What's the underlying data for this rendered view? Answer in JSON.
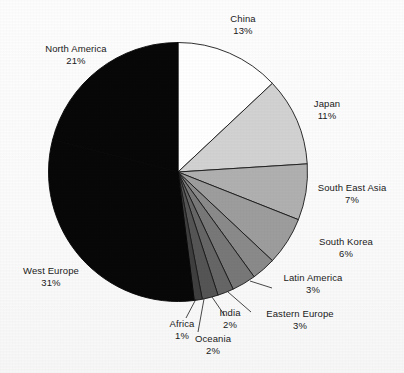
{
  "chart_data": {
    "type": "pie",
    "title": "",
    "subtitle": "",
    "xlabel": "",
    "ylabel": "",
    "grid": false,
    "legend_position": "none",
    "label_format": "name above percent",
    "start_angle_deg": 0,
    "direction": "clockwise",
    "categories": [
      "China",
      "Japan",
      "South East Asia",
      "South Korea",
      "Latin America",
      "Eastern Europe",
      "India",
      "Oceania",
      "Africa",
      "West Europe",
      "North America"
    ],
    "values": [
      13,
      11,
      7,
      6,
      3,
      3,
      2,
      2,
      1,
      31,
      21
    ],
    "value_unit": "%",
    "total": 100,
    "slices": [
      {
        "label": "China",
        "value": 13,
        "percent_text": "13%",
        "color": "#ffffff",
        "stroke": "#1a1a1a"
      },
      {
        "label": "Japan",
        "value": 11,
        "percent_text": "11%",
        "color": "#d2d2d2",
        "stroke": "#1a1a1a"
      },
      {
        "label": "South East Asia",
        "value": 7,
        "percent_text": "7%",
        "color": "#b0b0b0",
        "stroke": "#1a1a1a"
      },
      {
        "label": "South Korea",
        "value": 6,
        "percent_text": "6%",
        "color": "#9d9d9d",
        "stroke": "#1a1a1a"
      },
      {
        "label": "Latin America",
        "value": 3,
        "percent_text": "3%",
        "color": "#8a8a8a",
        "stroke": "#1a1a1a"
      },
      {
        "label": "Eastern Europe",
        "value": 3,
        "percent_text": "3%",
        "color": "#787878",
        "stroke": "#1a1a1a"
      },
      {
        "label": "India",
        "value": 2,
        "percent_text": "2%",
        "color": "#666666",
        "stroke": "#1a1a1a"
      },
      {
        "label": "Oceania",
        "value": 2,
        "percent_text": "2%",
        "color": "#555555",
        "stroke": "#1a1a1a"
      },
      {
        "label": "Africa",
        "value": 1,
        "percent_text": "1%",
        "color": "#3f3f3f",
        "stroke": "#1a1a1a"
      },
      {
        "label": "West Europe",
        "value": 31,
        "percent_text": "31%",
        "color": "#080808",
        "stroke": "#080808"
      },
      {
        "label": "North America",
        "value": 21,
        "percent_text": "21%",
        "color": "#080808",
        "stroke": "#080808"
      }
    ]
  },
  "labels": {
    "china": {
      "name": "China",
      "percent": "13%"
    },
    "japan": {
      "name": "Japan",
      "percent": "11%"
    },
    "south_east_asia": {
      "name": "South East Asia",
      "percent": "7%"
    },
    "south_korea": {
      "name": "South Korea",
      "percent": "6%"
    },
    "latin_america": {
      "name": "Latin America",
      "percent": "3%"
    },
    "eastern_europe": {
      "name": "Eastern Europe",
      "percent": "3%"
    },
    "india": {
      "name": "India",
      "percent": "2%"
    },
    "oceania": {
      "name": "Oceania",
      "percent": "2%"
    },
    "africa": {
      "name": "Africa",
      "percent": "1%"
    },
    "west_europe": {
      "name": "West Europe",
      "percent": "31%"
    },
    "north_america": {
      "name": "North America",
      "percent": "21%"
    }
  },
  "style": {
    "background": "#fbfbfb",
    "text_color": "#1a1a1a",
    "outline_color": "#1a1a1a",
    "leader_line_color": "#1a1a1a"
  }
}
